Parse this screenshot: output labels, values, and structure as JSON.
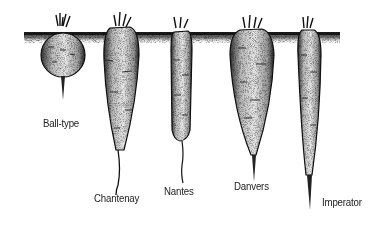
{
  "figure": {
    "soil_color": "#1a1a1a",
    "ink_color": "#111111",
    "fill_color": "#f2f2f2"
  },
  "carrots": [
    {
      "id": "ball-type",
      "label": "Ball-type"
    },
    {
      "id": "chantenay",
      "label": "Chantenay"
    },
    {
      "id": "nantes",
      "label": "Nantes"
    },
    {
      "id": "danvers",
      "label": "Danvers"
    },
    {
      "id": "imperator",
      "label": "Imperator"
    }
  ]
}
